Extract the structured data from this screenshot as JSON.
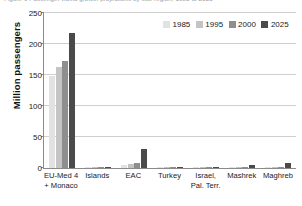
{
  "title_sliver": "Figure 9  Passenger traffic growth projections by sub-region, 1985 to 2025",
  "chart_data": {
    "type": "bar",
    "title": "",
    "xlabel": "",
    "ylabel": "Million passengers",
    "ylim": [
      0,
      250
    ],
    "yticks": [
      0,
      50,
      100,
      150,
      200,
      250
    ],
    "ytick_labels": [
      "0",
      "50",
      "100",
      "150",
      "200",
      "250"
    ],
    "grid": true,
    "legend_position": "top-right-inside",
    "categories": [
      "EU-Med 4 + Monaco",
      "Islands",
      "EAC",
      "Turkey",
      "Israel, Pal. Terr.",
      "Mashrek",
      "Maghreb"
    ],
    "category_lines": [
      [
        "EU-Med 4",
        "+ Monaco"
      ],
      [
        "Islands",
        ""
      ],
      [
        "EAC",
        ""
      ],
      [
        "Turkey",
        ""
      ],
      [
        "Israel,",
        "Pal. Terr."
      ],
      [
        "Mashrek",
        ""
      ],
      [
        "Maghreb",
        ""
      ]
    ],
    "series": [
      {
        "name": "1985",
        "color": "#e2e2e2",
        "values": [
          149,
          0.4,
          4.5,
          0.3,
          0.2,
          0.5,
          1.2
        ]
      },
      {
        "name": "1995",
        "color": "#c4c4c4",
        "values": [
          163,
          0.7,
          6.0,
          0.5,
          0.4,
          0.9,
          1.8
        ]
      },
      {
        "name": "2000",
        "color": "#8e8e8e",
        "values": [
          172,
          1.0,
          7.5,
          0.7,
          0.6,
          1.4,
          2.4
        ]
      },
      {
        "name": "2025",
        "color": "#4a4a4a",
        "values": [
          217,
          2.0,
          31.0,
          1.2,
          1.0,
          5.0,
          7.5
        ]
      }
    ]
  }
}
